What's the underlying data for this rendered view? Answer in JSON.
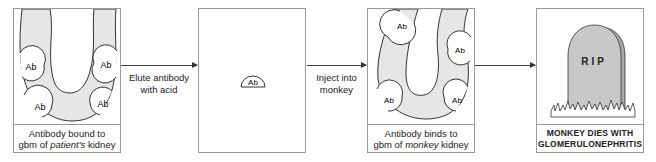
{
  "panels": [
    {
      "id": "patient-kidney",
      "antibody_label": "Ab",
      "caption_line1": "Antibody bound to",
      "caption_line2_prefix": "gbm of ",
      "caption_line2_em": "patient's",
      "caption_line2_suffix": " kidney"
    },
    {
      "id": "eluted-antibody",
      "antibody_label": "Ab"
    },
    {
      "id": "monkey-kidney",
      "antibody_label": "Ab",
      "caption_line1": "Antibody binds to",
      "caption_line2_prefix": "gbm of ",
      "caption_line2_em": "monkey",
      "caption_line2_suffix": " kidney"
    },
    {
      "id": "monkey-dies",
      "tombstone_text": "RIP",
      "caption_line1": "MONKEY DIES WITH",
      "caption_line2": "GLOMERULONEPHRITIS"
    }
  ],
  "arrows": [
    {
      "line1": "Elute antibody",
      "line2": "with acid"
    },
    {
      "line1": "Inject into",
      "line2": "monkey"
    },
    {
      "line1": "",
      "line2": ""
    }
  ],
  "colors": {
    "tissue_fill": "#e6e6e6",
    "outline": "#333333",
    "box_border": "#9a9a9a",
    "tombstone_fill": "#c8c8c8"
  }
}
